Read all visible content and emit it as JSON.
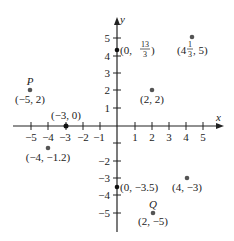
{
  "diagram": {
    "type": "coordinate-plane",
    "axes": {
      "x_label": "x",
      "y_label": "y",
      "x_ticks": [
        "-5",
        "-4",
        "-3",
        "-2",
        "-1",
        "1",
        "2",
        "3",
        "4",
        "5"
      ],
      "y_ticks": [
        "5",
        "4",
        "3",
        "2",
        "1",
        "-1",
        "-2",
        "-3",
        "-4",
        "-5"
      ]
    },
    "points": [
      {
        "name": "P",
        "label": "(-5, 2)",
        "x": -5,
        "y": 2
      },
      {
        "name": "",
        "label": "(-3, 0)",
        "x": -3,
        "y": 0
      },
      {
        "name": "",
        "label": "(-4, -1.2)",
        "x": -4,
        "y": -1.2
      },
      {
        "name": "",
        "label": "(0, 13/3)",
        "x": 0,
        "y": 4.333
      },
      {
        "name": "",
        "label": "(4 1/3, 5)",
        "x": 4.333,
        "y": 5
      },
      {
        "name": "",
        "label": "(2, 2)",
        "x": 2,
        "y": 2
      },
      {
        "name": "",
        "label": "(0, -3.5)",
        "x": 0,
        "y": -3.5
      },
      {
        "name": "",
        "label": "(4, -3)",
        "x": 4,
        "y": -3
      },
      {
        "name": "Q",
        "label": "(2, -5)",
        "x": 2,
        "y": -5
      }
    ],
    "text": {
      "p_name": "P",
      "q_name": "Q",
      "p_label": "(−5, 2)",
      "origin_m3_label": "(−3, 0)",
      "m4_label": "(−4, −1.2)",
      "y_int_open": "(0, ",
      "y_int_num": "13",
      "y_int_den": "3",
      "y_int_close": ")",
      "pt_mixed_open": "(4",
      "pt_mixed_num": "1",
      "pt_mixed_den": "3",
      "pt_mixed_close": ", 5)",
      "p22_label": "(2, 2)",
      "y_neg_label": "(0, −3.5)",
      "p4m3_label": "(4, −3)",
      "q_label": "(2, −5)",
      "x_ticks": [
        "−5",
        "−4",
        "−3",
        "−2",
        "−1",
        "1",
        "2",
        "3",
        "4",
        "5"
      ],
      "y_ticks": [
        "5",
        "4",
        "3",
        "2",
        "1",
        "−2",
        "−3",
        "−4",
        "−5"
      ]
    }
  }
}
